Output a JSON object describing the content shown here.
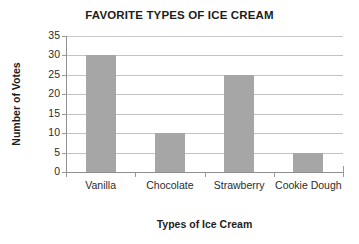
{
  "chart_data": {
    "type": "bar",
    "title": "FAVORITE TYPES OF ICE CREAM",
    "xlabel": "Types of Ice Cream",
    "ylabel": "Number of Votes",
    "categories": [
      "Vanilla",
      "Chocolate",
      "Strawberry",
      "Cookie Dough"
    ],
    "values": [
      30,
      10,
      25,
      5
    ],
    "series": [
      {
        "name": "Number of Votes",
        "values": [
          30,
          10,
          25,
          5
        ]
      }
    ],
    "ylim": [
      0,
      35
    ],
    "ytick_step": 5,
    "ytick_labels": [
      "35",
      "30",
      "25",
      "20",
      "15",
      "10",
      "5",
      "0"
    ],
    "ytick_values": [
      35,
      30,
      25,
      20,
      15,
      10,
      5,
      0
    ],
    "grid": true,
    "grid_axis": "y",
    "legend": false,
    "legend_position": "none",
    "bar_color": "#a6a6a6",
    "grid_color": "#c3c3c3",
    "axis_color": "#8f8f8f",
    "background_color": "#ffffff",
    "data_labels": false
  }
}
